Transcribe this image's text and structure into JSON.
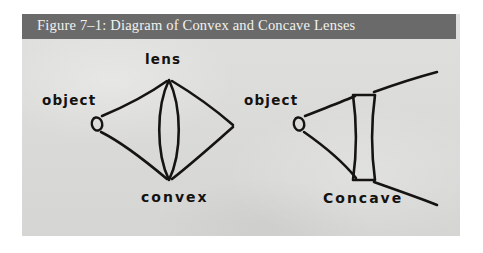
{
  "figure": {
    "caption": "Figure 7–1: Diagram of Convex and Concave Lenses",
    "caption_bar_color": "#6a6a6a",
    "caption_text_color": "#f2f2f0",
    "background_color": "#dcdcda",
    "ink_color": "#161412"
  },
  "diagrams": {
    "convex": {
      "lens_label": "lens",
      "object_label": "object",
      "name_label": "convex",
      "lens_type": "biconvex",
      "ray_behavior": "converging"
    },
    "concave": {
      "object_label": "object",
      "name_label": "Concave",
      "lens_type": "biconcave",
      "ray_behavior": "diverging"
    }
  }
}
